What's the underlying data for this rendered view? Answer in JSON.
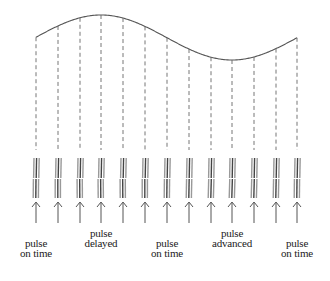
{
  "diagram": {
    "type": "pulse-timing",
    "colors": {
      "curve": "#555555",
      "dashes": "#666666",
      "pulse_dark": "#444444",
      "pulse_light": "#999999",
      "arrow": "#555555",
      "text": "#222222"
    },
    "curve": {
      "start": [
        36,
        37
      ],
      "peak": [
        101,
        15
      ],
      "trough": [
        232,
        60
      ],
      "end": [
        297,
        38
      ]
    },
    "columns_x": [
      36,
      58,
      80,
      101,
      123,
      145,
      167,
      189,
      211,
      232,
      254,
      276,
      297
    ],
    "labels": [
      {
        "id": "on-time-1",
        "line1": "pulse",
        "line2": "on time",
        "x": 36,
        "y": 238
      },
      {
        "id": "delayed",
        "line1": "pulse",
        "line2": "delayed",
        "x": 101,
        "y": 228
      },
      {
        "id": "on-time-2",
        "line1": "pulse",
        "line2": "on time",
        "x": 167,
        "y": 238
      },
      {
        "id": "advanced",
        "line1": "pulse",
        "line2": "advanced",
        "x": 232,
        "y": 228
      },
      {
        "id": "on-time-3",
        "line1": "pulse",
        "line2": "on time",
        "x": 297,
        "y": 238
      }
    ]
  }
}
